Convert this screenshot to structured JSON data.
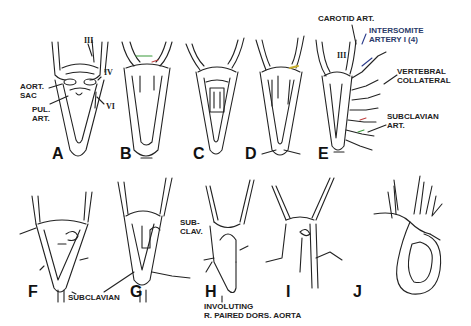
{
  "figure": {
    "stages": [
      {
        "id": "A",
        "label": "A"
      },
      {
        "id": "B",
        "label": "B"
      },
      {
        "id": "C",
        "label": "C"
      },
      {
        "id": "D",
        "label": "D"
      },
      {
        "id": "E",
        "label": "E"
      },
      {
        "id": "F",
        "label": "F"
      },
      {
        "id": "G",
        "label": "G"
      },
      {
        "id": "H",
        "label": "H"
      },
      {
        "id": "I",
        "label": "I"
      },
      {
        "id": "J",
        "label": "J"
      }
    ],
    "roman_numerals": {
      "a_iii": "III",
      "a_iv": "IV",
      "a_vi": "VI",
      "e_iii": "III"
    },
    "annotations": {
      "aort_sac_1": "AORT.",
      "aort_sac_2": "SAC",
      "pul_art_1": "PUL.",
      "pul_art_2": "ART.",
      "carotid_art": "CAROTID ART.",
      "intersomite_1": "INTERSOMITE",
      "intersomite_2": "ARTERY I (4)",
      "vertebral_1": "VERTEBRAL",
      "vertebral_2": "COLLATERAL",
      "subclavian_art_1": "SUBCLAVIAN",
      "subclavian_art_2": "ART.",
      "subclavian": "SUBCLAVIAN",
      "sub_clav_1": "SUB-",
      "sub_clav_2": "CLAV.",
      "involuting_1": "INVOLUTING",
      "involuting_2": "R. PAIRED DORS. AORTA"
    },
    "colors": {
      "line": "#222222",
      "accent_green": "#3a9a3a",
      "accent_blue": "#2a3a8a",
      "accent_red": "#c04040",
      "accent_yellow": "#c8b030"
    }
  }
}
